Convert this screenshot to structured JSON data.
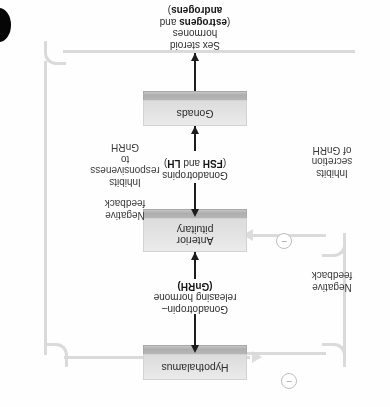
{
  "figure": {
    "orientation": "rotated-180",
    "nodes": {
      "hypothalamus": "Hypothalamus",
      "anterior_pituitary_line1": "Anterior",
      "anterior_pituitary_line2": "pituitary",
      "gonads": "Gonads"
    },
    "flow_labels": {
      "gnrh": {
        "line1": "Gonadotropin–",
        "line2": "releasing hormone",
        "line3_bold": "(GnRH)"
      },
      "gonadotropins": {
        "line1": "Gonadotropins",
        "line2_prefix": "(",
        "line2_bold1": "FSH",
        "line2_mid": " and ",
        "line2_bold2": "LH",
        "line2_suffix": ")"
      },
      "sex_steroids": {
        "line1": "Sex steroid",
        "line2": "hormones",
        "line3_prefix": "(",
        "line3_bold1": "estrogens",
        "line3_mid": " and",
        "line4_bold2": "androgens",
        "line4_suffix": ")"
      }
    },
    "feedback": {
      "left": {
        "title_line1": "Negative",
        "title_line2": "feedback",
        "effect_line1": "Inhibits",
        "effect_line2": "responsiveness",
        "effect_line3": "to",
        "effect_line4": "GnRH",
        "sign": "−"
      },
      "right": {
        "title_line1": "Negative",
        "title_line2": "feedback",
        "effect_line1": "Inhibits",
        "effect_line2": "secretion",
        "effect_line3": "of GnRH",
        "sign": "−"
      }
    },
    "colors": {
      "box_face": "#e4e4e4",
      "box_edge": "#b2b2b2",
      "arrow": "#1c1c1c",
      "feedback_line": "#dadada",
      "text": "#2f2f2f",
      "corner_mark": "#060606"
    }
  }
}
